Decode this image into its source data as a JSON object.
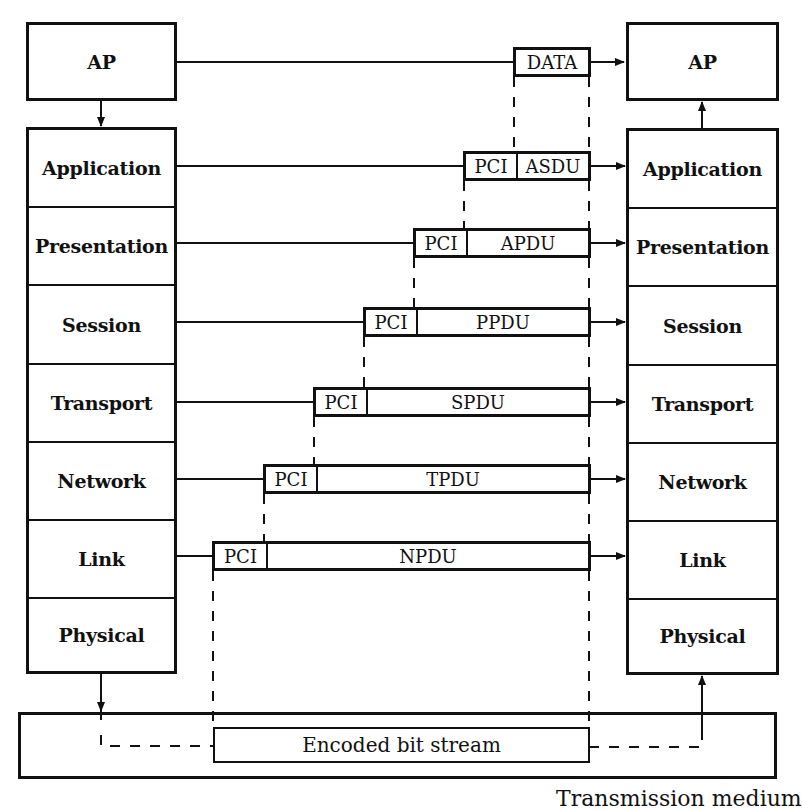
{
  "diagram": {
    "type": "OSI reference model data encapsulation",
    "left_ap": {
      "label": "AP"
    },
    "right_ap": {
      "label": "AP"
    },
    "layers": [
      {
        "name": "Application"
      },
      {
        "name": "Presentation"
      },
      {
        "name": "Session"
      },
      {
        "name": "Transport"
      },
      {
        "name": "Network"
      },
      {
        "name": "Link"
      },
      {
        "name": "Physical"
      }
    ],
    "data_unit": {
      "label": "DATA"
    },
    "pdus": [
      {
        "layer": "Application",
        "header": "PCI",
        "payload": "ASDU"
      },
      {
        "layer": "Presentation",
        "header": "PCI",
        "payload": "APDU"
      },
      {
        "layer": "Session",
        "header": "PCI",
        "payload": "PPDU"
      },
      {
        "layer": "Transport",
        "header": "PCI",
        "payload": "SPDU"
      },
      {
        "layer": "Network",
        "header": "PCI",
        "payload": "TPDU"
      },
      {
        "layer": "Link",
        "header": "PCI",
        "payload": "NPDU"
      }
    ],
    "bitstream": {
      "label": "Encoded bit stream"
    },
    "medium": {
      "label": "Transmission medium"
    },
    "colors": {
      "ink": "#111111",
      "background": "#ffffff"
    }
  }
}
